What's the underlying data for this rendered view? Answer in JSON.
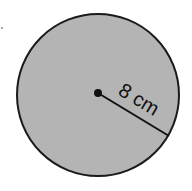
{
  "diagram": {
    "shape": "circle",
    "radius_label": "8 cm",
    "radius_value": 8,
    "radius_unit": "cm",
    "colors": {
      "fill": "#b4b4b4",
      "stroke": "#1a1a1a",
      "background": "#ffffff"
    }
  }
}
